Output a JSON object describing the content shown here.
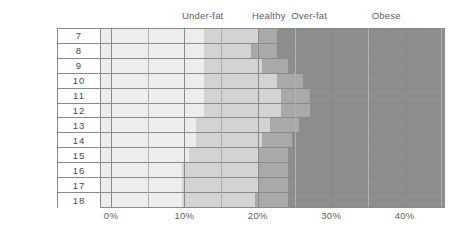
{
  "chart_data": {
    "type": "heatmap",
    "title": "",
    "subtitle": "",
    "xlabel": "",
    "ylabel": "",
    "xlim": [
      -1.5,
      45.5
    ],
    "ylim": [
      7,
      18
    ],
    "grid": true,
    "legend_position": "top",
    "x_ticks": [
      0,
      10,
      20,
      30,
      40
    ],
    "x_tick_labels": [
      "0%",
      "10%",
      "20%",
      "30%",
      "40%"
    ],
    "x_minor_step": 5,
    "y_label_header": "Age",
    "categories": [
      {
        "name": "Under-fat",
        "color": "#ededed",
        "header_x_pct": 12.5
      },
      {
        "name": "Healthy",
        "color": "#d3d3d3",
        "header_x_pct": 21.5
      },
      {
        "name": "Over-fat",
        "color": "#a9a9a9",
        "header_x_pct": 27.0
      },
      {
        "name": "Obese",
        "color": "#8d8d8d",
        "header_x_pct": 37.5
      }
    ],
    "rows": [
      {
        "age": "7",
        "boundaries": [
          12.5,
          20.0,
          22.5
        ]
      },
      {
        "age": "8",
        "boundaries": [
          12.5,
          19.0,
          22.5
        ]
      },
      {
        "age": "9",
        "boundaries": [
          12.5,
          20.5,
          24.0
        ]
      },
      {
        "age": "10",
        "boundaries": [
          12.5,
          22.5,
          26.0
        ]
      },
      {
        "age": "11",
        "boundaries": [
          12.5,
          23.0,
          27.0
        ]
      },
      {
        "age": "12",
        "boundaries": [
          12.5,
          23.0,
          27.0
        ]
      },
      {
        "age": "13",
        "boundaries": [
          11.5,
          21.5,
          25.5
        ]
      },
      {
        "age": "14",
        "boundaries": [
          11.5,
          20.5,
          24.5
        ]
      },
      {
        "age": "15",
        "boundaries": [
          10.5,
          20.0,
          24.0
        ]
      },
      {
        "age": "16",
        "boundaries": [
          9.5,
          20.0,
          24.0
        ]
      },
      {
        "age": "17",
        "boundaries": [
          9.5,
          20.0,
          24.0
        ]
      },
      {
        "age": "18",
        "boundaries": [
          9.5,
          19.5,
          24.0
        ]
      }
    ]
  }
}
